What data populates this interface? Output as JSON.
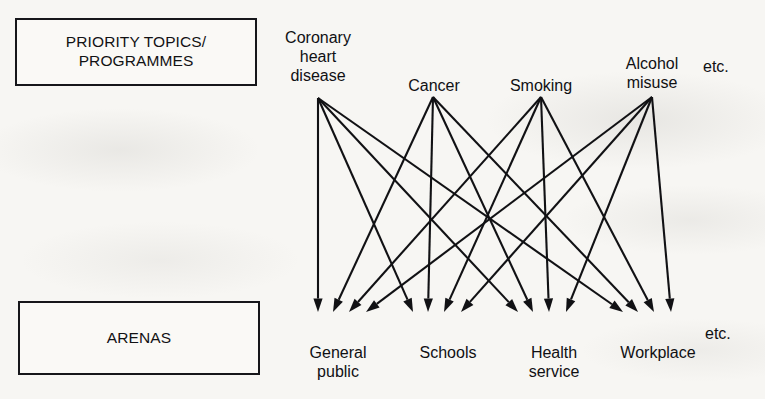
{
  "diagram": {
    "type": "bipartite-network",
    "ink_color": "#111114",
    "page_color": "#f7f6f3"
  },
  "groups": {
    "top": {
      "box_label": "PRIORITY TOPICS/\nPROGRAMMES",
      "etc_label": "etc."
    },
    "bottom": {
      "box_label": "ARENAS",
      "etc_label": "etc."
    }
  },
  "topics": [
    {
      "id": "coronary-heart-disease",
      "label": "Coronary\nheart\ndisease",
      "x": 318,
      "y": 98
    },
    {
      "id": "cancer",
      "label": "Cancer",
      "x": 433,
      "y": 97
    },
    {
      "id": "smoking",
      "label": "Smoking",
      "x": 541,
      "y": 97
    },
    {
      "id": "alcohol-misuse",
      "label": "Alcohol\nmisuse",
      "x": 652,
      "y": 97
    }
  ],
  "arenas": [
    {
      "id": "general-public",
      "label": "General\npublic",
      "x": 340,
      "y": 316
    },
    {
      "id": "schools",
      "label": "Schools",
      "x": 448,
      "y": 316
    },
    {
      "id": "health-service",
      "label": "Health\nservice",
      "x": 553,
      "y": 316
    },
    {
      "id": "workplace",
      "label": "Workplace",
      "x": 657,
      "y": 316
    }
  ],
  "links": [
    {
      "from": "coronary-heart-disease",
      "to": "general-public"
    },
    {
      "from": "coronary-heart-disease",
      "to": "schools"
    },
    {
      "from": "coronary-heart-disease",
      "to": "health-service"
    },
    {
      "from": "coronary-heart-disease",
      "to": "workplace"
    },
    {
      "from": "cancer",
      "to": "general-public"
    },
    {
      "from": "cancer",
      "to": "schools"
    },
    {
      "from": "cancer",
      "to": "health-service"
    },
    {
      "from": "cancer",
      "to": "workplace"
    },
    {
      "from": "smoking",
      "to": "general-public"
    },
    {
      "from": "smoking",
      "to": "schools"
    },
    {
      "from": "smoking",
      "to": "health-service"
    },
    {
      "from": "smoking",
      "to": "workplace"
    },
    {
      "from": "alcohol-misuse",
      "to": "general-public"
    },
    {
      "from": "alcohol-misuse",
      "to": "schools"
    },
    {
      "from": "alcohol-misuse",
      "to": "health-service"
    },
    {
      "from": "alcohol-misuse",
      "to": "workplace"
    }
  ],
  "geometry": {
    "arrow_tip_y": 312,
    "fan_offsets": [
      0,
      15,
      31,
      48
    ],
    "arena_fan_base_x": [
      318,
      413,
      518,
      623
    ],
    "label_positions": {
      "topics_text_y": [
        10,
        54,
        60,
        54
      ],
      "etc_top": {
        "x": 703,
        "y": 63
      },
      "etc_bottom": {
        "x": 705,
        "y": 332
      }
    }
  }
}
